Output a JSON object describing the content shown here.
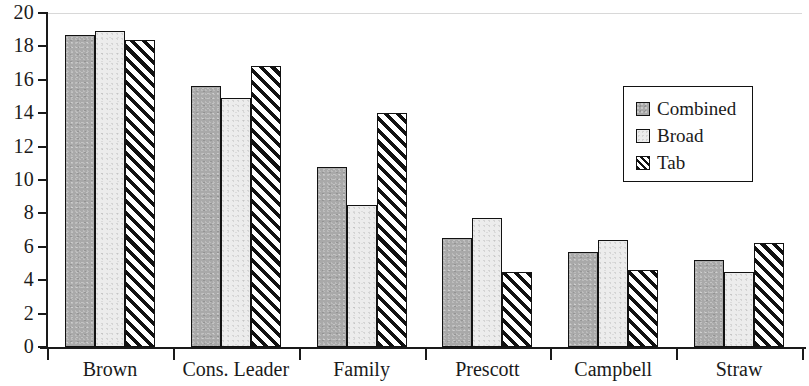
{
  "chart_data": {
    "type": "bar",
    "title": "",
    "subtitle": "",
    "xlabel": "",
    "ylabel": "",
    "ylim": [
      0,
      20
    ],
    "y_ticks": [
      0,
      2,
      4,
      6,
      8,
      10,
      12,
      14,
      16,
      18,
      20
    ],
    "grid": false,
    "legend_position": "top-right",
    "categories": [
      "Brown",
      "Cons. Leader",
      "Family",
      "Prescott",
      "Campbell",
      "Straw"
    ],
    "series": [
      {
        "name": "Combined",
        "color": "#a9a9a9",
        "pattern": "solid-gray",
        "values": [
          18.7,
          15.6,
          10.8,
          6.5,
          5.7,
          5.2
        ]
      },
      {
        "name": "Broad",
        "color": "#ececec",
        "pattern": "light-gray",
        "values": [
          18.9,
          14.9,
          8.5,
          7.7,
          6.4,
          4.5
        ]
      },
      {
        "name": "Tab",
        "color": "#ffffff",
        "pattern": "diagonal-hatch",
        "values": [
          18.4,
          16.8,
          14.0,
          4.5,
          4.6,
          6.2
        ]
      }
    ]
  },
  "axis": {
    "y_tick_labels": [
      "0",
      "2",
      "4",
      "6",
      "8",
      "10",
      "12",
      "14",
      "16",
      "18",
      "20"
    ],
    "x_tick_labels": [
      "Brown",
      "Cons. Leader",
      "Family",
      "Prescott",
      "Campbell",
      "Straw"
    ]
  },
  "legend": {
    "entries": [
      {
        "label": "Combined"
      },
      {
        "label": "Broad"
      },
      {
        "label": "Tab"
      }
    ]
  }
}
